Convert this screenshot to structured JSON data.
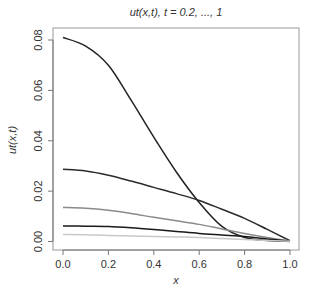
{
  "chart_data": {
    "type": "line",
    "title": "ut(x,t), t = 0.2, ..., 1",
    "xlabel": "x",
    "ylabel": "ut(x,t)",
    "xlim": [
      0,
      1
    ],
    "ylim": [
      0,
      0.08
    ],
    "grid": false,
    "legend": null,
    "x_ticks": [
      0.0,
      0.2,
      0.4,
      0.6,
      0.8,
      1.0
    ],
    "x_tick_labels": [
      "0.0",
      "0.2",
      "0.4",
      "0.6",
      "0.8",
      "1.0"
    ],
    "y_ticks": [
      0.0,
      0.02,
      0.04,
      0.06,
      0.08
    ],
    "y_tick_labels": [
      "0.00",
      "0.02",
      "0.04",
      "0.06",
      "0.08"
    ],
    "x": [
      0.0,
      0.1,
      0.2,
      0.3,
      0.4,
      0.5,
      0.6,
      0.7,
      0.8,
      0.9,
      1.0
    ],
    "series": [
      {
        "name": "t = 0.2",
        "color": "#222222",
        "values": [
          0.081,
          0.0776,
          0.07,
          0.0561,
          0.0414,
          0.0275,
          0.0155,
          0.006,
          0.0016,
          0.0004,
          0.0
        ]
      },
      {
        "name": "t = 0.4",
        "color": "#2a2a2a",
        "values": [
          0.0287,
          0.028,
          0.0263,
          0.024,
          0.0215,
          0.019,
          0.0163,
          0.0128,
          0.0092,
          0.0048,
          0.0003
        ]
      },
      {
        "name": "t = 0.6",
        "color": "#8a8a8a",
        "values": [
          0.0135,
          0.0132,
          0.0124,
          0.0111,
          0.0096,
          0.0082,
          0.0068,
          0.005,
          0.0032,
          0.0016,
          0.0002
        ]
      },
      {
        "name": "t = 0.8",
        "color": "#1a1a1a",
        "values": [
          0.0062,
          0.0061,
          0.006,
          0.0055,
          0.0048,
          0.004,
          0.0032,
          0.0026,
          0.002,
          0.001,
          0.0001
        ]
      },
      {
        "name": "t = 1.0",
        "color": "#c8c8c8",
        "values": [
          0.0028,
          0.0027,
          0.0024,
          0.0022,
          0.002,
          0.0018,
          0.0016,
          0.0012,
          0.0008,
          0.0004,
          0.0001
        ]
      }
    ]
  }
}
